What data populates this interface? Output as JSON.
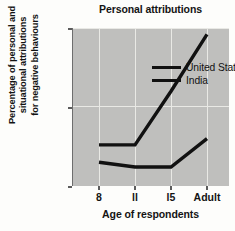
{
  "chart_data": {
    "type": "line",
    "title": "Personal attributions",
    "xlabel": "Age of respondents",
    "ylabel": "Percentage of personal and\nsituational attributions\nfor negative behaviours",
    "categories": [
      "8",
      "11",
      "15",
      "Adult"
    ],
    "tick_labels_x": [
      "8",
      "ll",
      "l5",
      "Adult"
    ],
    "series": [
      {
        "name": "United States",
        "values": [
          13,
          13,
          30,
          48
        ],
        "color": "#111111"
      },
      {
        "name": "India",
        "values": [
          7.5,
          6,
          6,
          15
        ],
        "color": "#111111"
      }
    ],
    "ylim": [
      0,
      50
    ],
    "yticks": [
      0,
      25,
      50
    ],
    "ytick_labels": [
      "0",
      "25",
      "50"
    ],
    "grid": true,
    "legend_position": "top-left",
    "plot_background": "#bfbfbd",
    "figure_background": "#fdfdfb"
  },
  "legend": {
    "entries": [
      {
        "label": "United States"
      },
      {
        "label": "India"
      }
    ]
  }
}
